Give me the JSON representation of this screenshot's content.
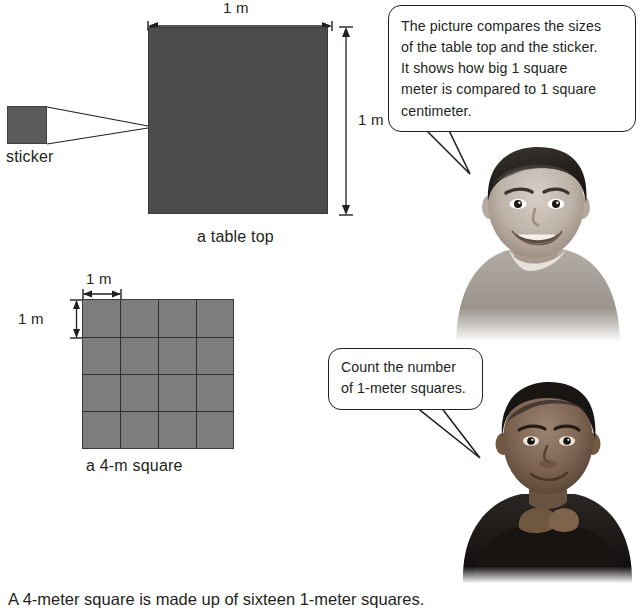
{
  "page": {
    "background_color": "#ffffff",
    "text_color": "#231f20"
  },
  "figures": {
    "table_top": {
      "caption": "a table top",
      "fill_color": "#4c4c4c",
      "width_label": "1 m",
      "height_label": "1 m"
    },
    "sticker": {
      "label": "sticker",
      "fill_color": "#5a5a5a"
    },
    "grid_square": {
      "caption": "a 4-m square",
      "fill_color": "#7d7d7d",
      "line_color": "#2f2f2f",
      "cell_width_label": "1 m",
      "cell_height_label": "1 m",
      "rows": 4,
      "columns": 4,
      "total_cells": "16"
    }
  },
  "speech_bubbles": [
    {
      "id": "bubble-one",
      "lines": [
        "The picture compares the sizes",
        "of the table top and the sticker.",
        "It shows how big 1 square",
        "meter is compared to 1 square",
        "centimeter."
      ]
    },
    {
      "id": "bubble-two",
      "lines": [
        "Count the number",
        "of 1-meter squares."
      ]
    }
  ],
  "photos": [
    {
      "id": "photo-boy-smiling",
      "alt_name": "smiling-boy-photo"
    },
    {
      "id": "photo-child-chin-on-hands",
      "alt_name": "child-resting-chin-photo"
    }
  ],
  "bottom_text": "A 4-meter square is made up of sixteen 1-meter squares."
}
